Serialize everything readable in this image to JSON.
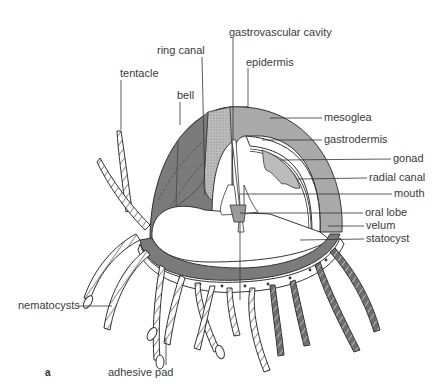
{
  "figure": {
    "panel_label": "a",
    "colors": {
      "bell_dark": "#7b7b7b",
      "mesoglea": "#a9a9a9",
      "ring_stipple": "#b8b8b8",
      "interior": "#ffffff",
      "line": "#3a3a3a",
      "tentacle_dark": "#6e6e6e"
    }
  },
  "labels": {
    "gastrovascular_cavity": "gastrovascular cavity",
    "ring_canal": "ring canal",
    "epidermis": "epidermis",
    "tentacle": "tentacle",
    "bell": "bell",
    "mesoglea": "mesoglea",
    "gastrodermis": "gastrodermis",
    "gonad": "gonad",
    "radial_canal": "radial canal",
    "mouth": "mouth",
    "oral_lobe": "oral lobe",
    "velum": "velum",
    "statocyst": "statocyst",
    "nematocysts": "nematocysts",
    "adhesive_pad": "adhesive pad"
  }
}
